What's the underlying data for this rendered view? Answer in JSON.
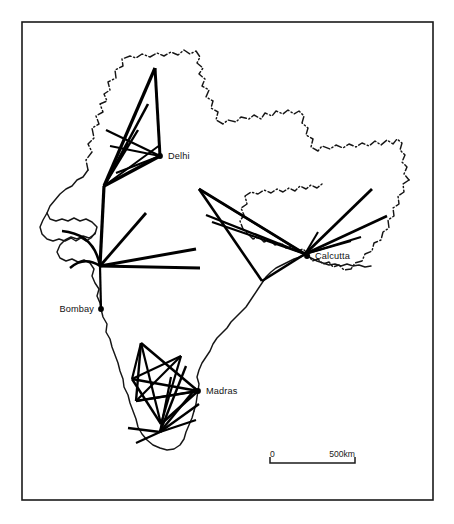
{
  "figure": {
    "frame": {
      "x": 22,
      "y": 22,
      "width": 411,
      "height": 478
    },
    "background_color": "#ffffff",
    "line_color": "#000000",
    "border_color": "#161616"
  },
  "cities": [
    {
      "name": "Delhi",
      "dot_x": 160,
      "dot_y": 156,
      "label_x": 168,
      "label_y": 159,
      "align": "right"
    },
    {
      "name": "Calcutta",
      "dot_x": 307,
      "dot_y": 256,
      "label_x": 315,
      "label_y": 259,
      "align": "right"
    },
    {
      "name": "Bombay",
      "dot_x": 101,
      "dot_y": 309,
      "label_x": 94,
      "label_y": 312,
      "align": "left"
    },
    {
      "name": "Madras",
      "dot_x": 198,
      "dot_y": 391,
      "label_x": 206,
      "label_y": 394,
      "align": "right"
    }
  ],
  "scale_bar": {
    "start_label": "0",
    "end_label": "500km",
    "x1": 270,
    "x2": 355,
    "y": 463,
    "tick_height": 6,
    "label_y": 457
  },
  "chart_data": {
    "type": "map",
    "map_region": "India",
    "nodes": [
      {
        "name": "Delhi",
        "x": 160,
        "y": 156
      },
      {
        "name": "Calcutta",
        "x": 307,
        "y": 256
      },
      {
        "name": "Bombay",
        "x": 101,
        "y": 309
      },
      {
        "name": "Madras",
        "x": 198,
        "y": 391
      }
    ],
    "hubs": [
      {
        "name": "delhi-fan-apex",
        "x": 104,
        "y": 186
      },
      {
        "name": "bombay-hub",
        "x": 100,
        "y": 266
      },
      {
        "name": "calcutta-hub",
        "x": 305,
        "y": 254
      },
      {
        "name": "madras-mesh-core",
        "x": 168,
        "y": 388
      },
      {
        "name": "south-fan-apex",
        "x": 160,
        "y": 432
      }
    ],
    "scale": {
      "units": "km",
      "min": 0,
      "max": 500,
      "pixel_length": 85
    },
    "borders": {
      "international": "dash-dot",
      "coastline": "solid"
    },
    "flows": [
      {
        "group": "delhi",
        "x1": 160,
        "y1": 156,
        "x2": 155,
        "y2": 68,
        "width": 3.0
      },
      {
        "group": "delhi",
        "x1": 160,
        "y1": 156,
        "x2": 106,
        "y2": 130,
        "width": 2.2
      },
      {
        "group": "delhi",
        "x1": 160,
        "y1": 156,
        "x2": 110,
        "y2": 146,
        "width": 2.0
      },
      {
        "group": "delhi",
        "x1": 160,
        "y1": 156,
        "x2": 104,
        "y2": 186,
        "width": 3.4
      },
      {
        "group": "delhi",
        "x1": 160,
        "y1": 156,
        "x2": 116,
        "y2": 173,
        "width": 2.2
      },
      {
        "group": "delhi",
        "x1": 155,
        "y1": 68,
        "x2": 104,
        "y2": 186,
        "width": 3.2
      },
      {
        "group": "delhi",
        "x1": 148,
        "y1": 104,
        "x2": 104,
        "y2": 186,
        "width": 2.6
      },
      {
        "group": "delhi",
        "x1": 138,
        "y1": 130,
        "x2": 104,
        "y2": 186,
        "width": 2.4
      },
      {
        "group": "delhi",
        "x1": 128,
        "y1": 143,
        "x2": 104,
        "y2": 186,
        "width": 2.2
      },
      {
        "group": "delhi",
        "x1": 160,
        "y1": 145,
        "x2": 104,
        "y2": 186,
        "width": 2.0
      },
      {
        "group": "delhi-bombay",
        "x1": 104,
        "y1": 186,
        "x2": 100,
        "y2": 266,
        "width": 3.2
      },
      {
        "group": "bombay",
        "x1": 100,
        "y1": 266,
        "x2": 146,
        "y2": 213,
        "width": 2.8
      },
      {
        "group": "bombay",
        "x1": 100,
        "y1": 266,
        "x2": 196,
        "y2": 249,
        "width": 3.0
      },
      {
        "group": "bombay",
        "x1": 100,
        "y1": 266,
        "x2": 200,
        "y2": 268,
        "width": 3.0
      },
      {
        "group": "bombay",
        "x1": 100,
        "y1": 266,
        "x2": 101,
        "y2": 309,
        "width": 2.2
      },
      {
        "group": "bombay",
        "x1": 100,
        "y1": 266,
        "x2": 62,
        "y2": 231,
        "width": 2.6,
        "curve": true
      },
      {
        "group": "bombay",
        "x1": 100,
        "y1": 266,
        "x2": 70,
        "y2": 268,
        "width": 2.4,
        "curve": true
      },
      {
        "group": "calcutta",
        "x1": 305,
        "y1": 254,
        "x2": 199,
        "y2": 189,
        "width": 2.8
      },
      {
        "group": "calcutta",
        "x1": 305,
        "y1": 254,
        "x2": 206,
        "y2": 215,
        "width": 2.4
      },
      {
        "group": "calcutta",
        "x1": 305,
        "y1": 254,
        "x2": 212,
        "y2": 222,
        "width": 2.2
      },
      {
        "group": "calcutta",
        "x1": 305,
        "y1": 254,
        "x2": 199,
        "y2": 189,
        "width": 2.0
      },
      {
        "group": "calcutta",
        "x1": 199,
        "y1": 189,
        "x2": 262,
        "y2": 281,
        "width": 2.6
      },
      {
        "group": "calcutta",
        "x1": 262,
        "y1": 281,
        "x2": 305,
        "y2": 254,
        "width": 2.6
      },
      {
        "group": "calcutta",
        "x1": 305,
        "y1": 254,
        "x2": 372,
        "y2": 189,
        "width": 2.8
      },
      {
        "group": "calcutta",
        "x1": 305,
        "y1": 254,
        "x2": 387,
        "y2": 216,
        "width": 2.6
      },
      {
        "group": "calcutta",
        "x1": 305,
        "y1": 254,
        "x2": 361,
        "y2": 237,
        "width": 2.2
      },
      {
        "group": "calcutta",
        "x1": 305,
        "y1": 254,
        "x2": 351,
        "y2": 241,
        "width": 2.0
      },
      {
        "group": "calcutta",
        "x1": 305,
        "y1": 254,
        "x2": 318,
        "y2": 232,
        "width": 2.0
      },
      {
        "group": "madras",
        "x1": 198,
        "y1": 391,
        "x2": 141,
        "y2": 343,
        "width": 2.6
      },
      {
        "group": "madras",
        "x1": 198,
        "y1": 391,
        "x2": 132,
        "y2": 379,
        "width": 2.6
      },
      {
        "group": "madras",
        "x1": 198,
        "y1": 391,
        "x2": 136,
        "y2": 401,
        "width": 2.4
      },
      {
        "group": "madras",
        "x1": 198,
        "y1": 391,
        "x2": 161,
        "y2": 424,
        "width": 2.6
      },
      {
        "group": "madras",
        "x1": 141,
        "y1": 343,
        "x2": 132,
        "y2": 379,
        "width": 2.2
      },
      {
        "group": "madras",
        "x1": 141,
        "y1": 343,
        "x2": 136,
        "y2": 401,
        "width": 2.4
      },
      {
        "group": "madras",
        "x1": 141,
        "y1": 343,
        "x2": 161,
        "y2": 424,
        "width": 2.2
      },
      {
        "group": "madras",
        "x1": 132,
        "y1": 379,
        "x2": 181,
        "y2": 356,
        "width": 2.0
      },
      {
        "group": "madras",
        "x1": 132,
        "y1": 379,
        "x2": 161,
        "y2": 424,
        "width": 2.4
      },
      {
        "group": "madras",
        "x1": 136,
        "y1": 401,
        "x2": 181,
        "y2": 356,
        "width": 2.2
      },
      {
        "group": "madras",
        "x1": 136,
        "y1": 401,
        "x2": 198,
        "y2": 391,
        "width": 2.2
      },
      {
        "group": "madras",
        "x1": 181,
        "y1": 356,
        "x2": 161,
        "y2": 424,
        "width": 2.2
      },
      {
        "group": "south-fan",
        "x1": 160,
        "y1": 432,
        "x2": 186,
        "y2": 366,
        "width": 2.4
      },
      {
        "group": "south-fan",
        "x1": 160,
        "y1": 432,
        "x2": 196,
        "y2": 388,
        "width": 2.4
      },
      {
        "group": "south-fan",
        "x1": 160,
        "y1": 432,
        "x2": 199,
        "y2": 404,
        "width": 2.4
      },
      {
        "group": "south-fan",
        "x1": 160,
        "y1": 432,
        "x2": 196,
        "y2": 420,
        "width": 2.2
      },
      {
        "group": "south-fan",
        "x1": 160,
        "y1": 432,
        "x2": 128,
        "y2": 428,
        "width": 2.4
      },
      {
        "group": "south-fan",
        "x1": 160,
        "y1": 432,
        "x2": 136,
        "y2": 443,
        "width": 2.2
      },
      {
        "group": "south-fan",
        "x1": 160,
        "y1": 432,
        "x2": 171,
        "y2": 377,
        "width": 2.2
      }
    ]
  }
}
